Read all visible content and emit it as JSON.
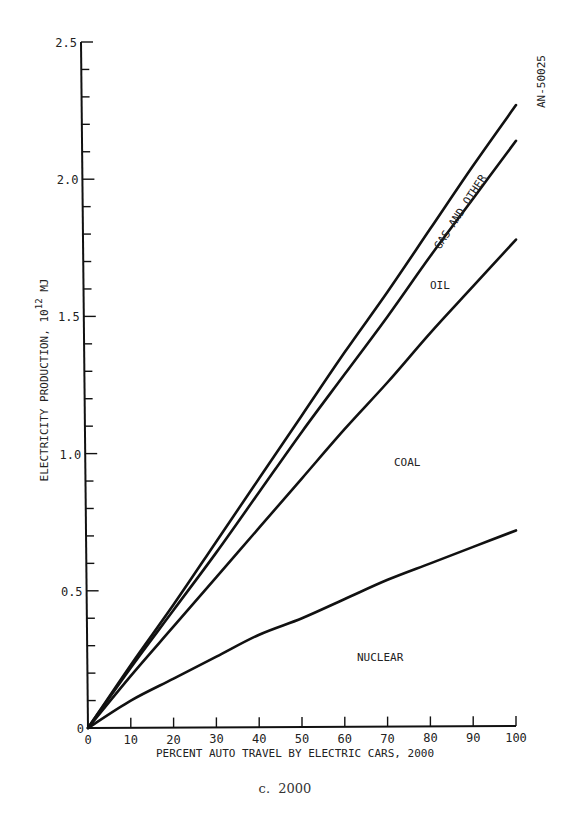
{
  "chart_data": {
    "type": "line",
    "title": "",
    "caption": "c.  2000",
    "figure_id": "AN-50025",
    "xlabel": "PERCENT AUTO TRAVEL BY ELECTRIC CARS, 2000",
    "ylabel": "ELECTRICITY PRODUCTION, 10^12 MJ",
    "ylabel_base": "ELECTRICITY PRODUCTION, 10",
    "ylabel_exp": "12",
    "ylabel_unit": " MJ",
    "xlim": [
      0,
      100
    ],
    "ylim": [
      0,
      2.5
    ],
    "x_ticks": [
      0,
      10,
      20,
      30,
      40,
      50,
      60,
      70,
      80,
      90,
      100
    ],
    "x_tick_labels": [
      "0",
      "10",
      "20",
      "30",
      "40",
      "50",
      "60",
      "70",
      "80",
      "90",
      "100"
    ],
    "y_major_ticks": [
      0,
      0.5,
      1.0,
      1.5,
      2.0,
      2.5
    ],
    "y_tick_labels": [
      "0",
      "0.5",
      "1.0",
      "1.5",
      "2.0",
      "2.5"
    ],
    "y_minor_step": 0.1,
    "grid": false,
    "legend": "none (regions labeled inline)",
    "x": [
      0,
      10,
      20,
      30,
      40,
      50,
      60,
      70,
      80,
      90,
      100
    ],
    "series": [
      {
        "name": "Total (top boundary)",
        "values": [
          0,
          0.23,
          0.45,
          0.68,
          0.91,
          1.14,
          1.37,
          1.59,
          1.82,
          2.05,
          2.27
        ]
      },
      {
        "name": "Gas and other / Oil boundary",
        "values": [
          0,
          0.22,
          0.43,
          0.64,
          0.86,
          1.08,
          1.29,
          1.5,
          1.72,
          1.93,
          2.14
        ]
      },
      {
        "name": "Oil / Coal boundary",
        "values": [
          0,
          0.19,
          0.37,
          0.55,
          0.73,
          0.91,
          1.09,
          1.26,
          1.44,
          1.61,
          1.78
        ]
      },
      {
        "name": "Coal / Nuclear boundary",
        "values": [
          0,
          0.1,
          0.18,
          0.26,
          0.34,
          0.4,
          0.47,
          0.54,
          0.6,
          0.66,
          0.72
        ]
      }
    ],
    "region_labels": [
      {
        "text": "GAS AND OTHER",
        "x": 80,
        "y": 1.95,
        "rotation": -57
      },
      {
        "text": "OIL",
        "x": 80,
        "y": 1.67
      },
      {
        "text": "COAL",
        "x": 70,
        "y": 1.0
      },
      {
        "text": "NUCLEAR",
        "x": 74,
        "y": 0.25
      }
    ]
  }
}
